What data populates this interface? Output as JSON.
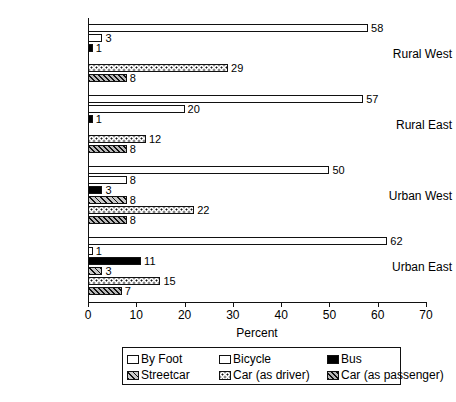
{
  "chart_data": {
    "type": "bar",
    "orientation": "horizontal",
    "title": "",
    "xlabel": "Percent",
    "ylabel": "",
    "xlim": [
      0,
      70
    ],
    "xticks": [
      0,
      10,
      20,
      30,
      40,
      50,
      60,
      70
    ],
    "grid": false,
    "legend_position": "bottom",
    "categories": [
      "Rural West",
      "Rural East",
      "Urban West",
      "Urban East"
    ],
    "series": [
      {
        "name": "By Foot",
        "pattern": "white",
        "values": [
          58,
          57,
          50,
          62
        ]
      },
      {
        "name": "Bicycle",
        "pattern": "sparse-dots",
        "values": [
          3,
          20,
          8,
          1
        ]
      },
      {
        "name": "Bus",
        "pattern": "solid-black",
        "values": [
          1,
          1,
          3,
          11
        ]
      },
      {
        "name": "Streetcar",
        "pattern": "hatch-dark",
        "values": [
          0,
          0,
          8,
          3
        ]
      },
      {
        "name": "Car (as driver)",
        "pattern": "dots",
        "values": [
          29,
          12,
          22,
          15
        ]
      },
      {
        "name": "Car (as passenger)",
        "pattern": "hatch",
        "values": [
          8,
          8,
          8,
          7
        ]
      }
    ],
    "value_labels": {
      "Rural West": [
        "58",
        "3",
        "1",
        "",
        "29",
        "8"
      ],
      "Rural East": [
        "57",
        "20",
        "1",
        "",
        "12",
        "8"
      ],
      "Urban West": [
        "50",
        "8",
        "3",
        "8",
        "22",
        "8"
      ],
      "Urban East": [
        "62",
        "1",
        "11",
        "3",
        "15",
        "7"
      ]
    }
  },
  "axis": {
    "x_title": "Percent",
    "x_tick_labels": [
      "0",
      "10",
      "20",
      "30",
      "40",
      "50",
      "60",
      "70"
    ],
    "category_labels": [
      "Rural West",
      "Rural East",
      "Urban West",
      "Urban East"
    ]
  },
  "legend": {
    "items": [
      {
        "label": "By Foot",
        "swatch": "white"
      },
      {
        "label": "Bicycle",
        "swatch": "sparse-dots"
      },
      {
        "label": "Bus",
        "swatch": "solid-black"
      },
      {
        "label": "Streetcar",
        "swatch": "hatch-dark"
      },
      {
        "label": "Car (as driver)",
        "swatch": "dots"
      },
      {
        "label": "Car (as passenger)",
        "swatch": "hatch"
      }
    ]
  },
  "colors": {
    "ink": "#111111",
    "background": "#ffffff",
    "bus_fill": "#000000",
    "hatch_fill": "#b8b8b8"
  }
}
